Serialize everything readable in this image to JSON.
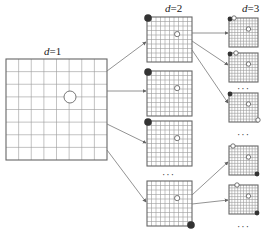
{
  "levels": [
    {
      "label": "d=1",
      "var": "d",
      "value": "1"
    },
    {
      "label": "d=2",
      "var": "d",
      "value": "2"
    },
    {
      "label": "d=3",
      "var": "d",
      "value": "3"
    }
  ],
  "ellipsis": "···",
  "colors": {
    "grid_line": "#9a9a9a",
    "grid_border": "#666666",
    "arrow": "#777777",
    "filled_marker": "#333333",
    "open_marker": "#ffffff"
  },
  "d1": {
    "grid": {
      "x": 6,
      "y": 59,
      "size": 101,
      "cells": 8
    },
    "circle": {
      "cx": 70,
      "cy": 97,
      "r": 6
    }
  },
  "d2": {
    "grids": [
      {
        "x": 147,
        "y": 17,
        "size": 45,
        "cells": 10,
        "marker": "top-left"
      },
      {
        "x": 147,
        "y": 71,
        "size": 45,
        "cells": 10,
        "marker": "top-left"
      },
      {
        "x": 147,
        "y": 121,
        "size": 45,
        "cells": 10,
        "marker": "top-left"
      },
      {
        "x": 147,
        "y": 181,
        "size": 45,
        "cells": 10,
        "marker": "bottom-right"
      }
    ]
  },
  "d3": {
    "grids": [
      {
        "x": 229,
        "y": 18,
        "size": 29,
        "cells": 10,
        "marker": "top-left-pair-a"
      },
      {
        "x": 229,
        "y": 53,
        "size": 29,
        "cells": 10,
        "marker": "top-left-pair-b"
      },
      {
        "x": 229,
        "y": 93,
        "size": 29,
        "cells": 10,
        "marker": "top-left-bottom-right"
      },
      {
        "x": 229,
        "y": 146,
        "size": 29,
        "cells": 10,
        "marker": "top-left-open-bottom-right"
      },
      {
        "x": 229,
        "y": 185,
        "size": 29,
        "cells": 10,
        "marker": "top-open-bottom-right"
      }
    ]
  }
}
